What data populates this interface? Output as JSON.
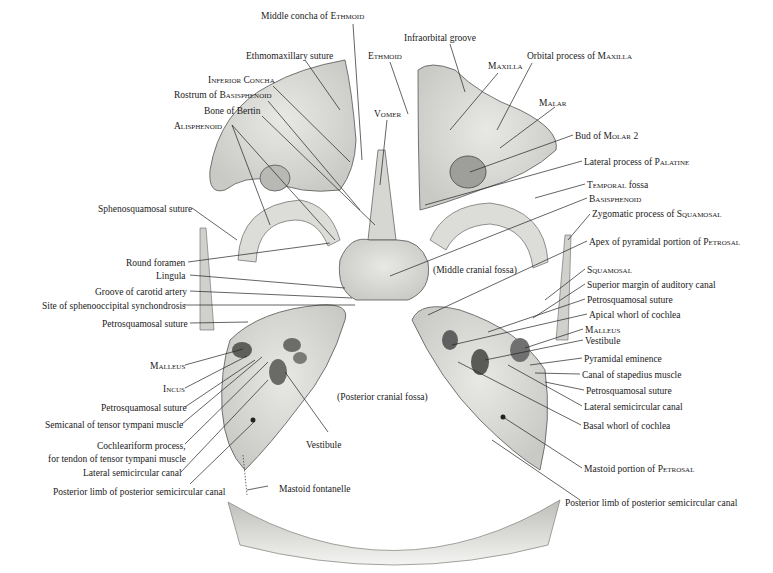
{
  "figure": {
    "colors": {
      "ink": "#1a1a1a",
      "bone_fill": "#d9d9d6",
      "bone_dark": "#6e6e6e",
      "background": "#ffffff"
    }
  },
  "regions": {
    "middle_cranial_fossa": "(Middle cranial fossa)",
    "posterior_cranial_fossa": "(Posterior cranial fossa)"
  },
  "labels_top": [
    {
      "id": "middle-concha",
      "plain": "Middle concha of ",
      "sc": "Ethmoid",
      "x": 261,
      "y": 11
    },
    {
      "id": "ethmomaxillary-suture",
      "plain": "Ethmomaxillary suture",
      "sc": "",
      "x": 246,
      "y": 51
    },
    {
      "id": "ethmoid",
      "plain": "",
      "sc": "Ethmoid",
      "x": 368,
      "y": 51
    },
    {
      "id": "infraorbital-groove",
      "plain": "Infraorbital groove",
      "sc": "",
      "x": 404,
      "y": 33
    },
    {
      "id": "maxilla",
      "plain": "",
      "sc": "Maxilla",
      "x": 488,
      "y": 61
    },
    {
      "id": "orbital-process",
      "plain": "Orbital process of ",
      "sc": "Maxilla",
      "x": 527,
      "y": 51
    }
  ],
  "labels_left": [
    {
      "id": "inferior-concha",
      "plain": "",
      "sc": "Inferior Concha",
      "x": 208,
      "y": 75
    },
    {
      "id": "rostrum",
      "plain": "Rostrum of ",
      "sc": "Basisphenoid",
      "x": 174,
      "y": 90
    },
    {
      "id": "bone-of-bertin",
      "plain": "Bone of Bertin",
      "sc": "",
      "x": 204,
      "y": 106
    },
    {
      "id": "alisphenoid",
      "plain": "",
      "sc": "Alisphenoid",
      "x": 174,
      "y": 121
    },
    {
      "id": "sphenosquamosal-suture",
      "plain": "Sphenosquamosal suture",
      "sc": "",
      "x": 98,
      "y": 204
    },
    {
      "id": "round-foramen",
      "plain": "Round foramen",
      "sc": "",
      "x": 126,
      "y": 258
    },
    {
      "id": "lingula",
      "plain": "Lingula",
      "sc": "",
      "x": 156,
      "y": 271
    },
    {
      "id": "groove-carotid",
      "plain": "Groove of carotid artery",
      "sc": "",
      "x": 95,
      "y": 287
    },
    {
      "id": "sphenooccipital",
      "plain": "Site of sphenooccipital synchondrosis",
      "sc": "",
      "x": 42,
      "y": 301
    },
    {
      "id": "petrosquamosal-l1",
      "plain": "Petrosquamosal suture",
      "sc": "",
      "x": 102,
      "y": 319
    },
    {
      "id": "malleus-l",
      "plain": "",
      "sc": "Malleus",
      "x": 150,
      "y": 361
    },
    {
      "id": "incus-l",
      "plain": "",
      "sc": "Incus",
      "x": 163,
      "y": 384
    },
    {
      "id": "petrosquamosal-l2",
      "plain": "Petrosquamosal suture",
      "sc": "",
      "x": 101,
      "y": 403
    },
    {
      "id": "semicanal-tensor",
      "plain": "Semicanal of tensor tympani muscle",
      "sc": "",
      "x": 45,
      "y": 420
    },
    {
      "id": "cochleariform-1",
      "plain": "Cochleariform process,",
      "sc": "",
      "x": 97,
      "y": 441
    },
    {
      "id": "cochleariform-2",
      "plain": "for tendon of tensor tympani muscle",
      "sc": "",
      "x": 48,
      "y": 454
    },
    {
      "id": "lateral-sc-l",
      "plain": "Lateral semicircular canal",
      "sc": "",
      "x": 83,
      "y": 468
    },
    {
      "id": "posterior-limb-l",
      "plain": "Posterior limb of posterior semicircular canal",
      "sc": "",
      "x": 53,
      "y": 487
    }
  ],
  "labels_center": [
    {
      "id": "vomer",
      "plain": "",
      "sc": "Vomer",
      "x": 374,
      "y": 109
    },
    {
      "id": "vestibule-l",
      "plain": "Vestibule",
      "sc": "",
      "x": 306,
      "y": 440
    },
    {
      "id": "mastoid-fontanelle",
      "plain": "Mastoid fontanelle",
      "sc": "",
      "x": 279,
      "y": 484
    }
  ],
  "labels_right": [
    {
      "id": "malar",
      "plain": "",
      "sc": "Malar",
      "x": 539,
      "y": 98
    },
    {
      "id": "bud-molar",
      "plain": "Bud of ",
      "sc": "Molar 2",
      "x": 575,
      "y": 131
    },
    {
      "id": "lateral-process-palatine",
      "plain": "Lateral process of ",
      "sc": "Palatine",
      "x": 584,
      "y": 157
    },
    {
      "id": "temporal-fossa",
      "plain": "",
      "sc": "Temporal",
      "plain2": " fossa",
      "x": 587,
      "y": 180
    },
    {
      "id": "basisphenoid",
      "plain": "",
      "sc": "Basisphenoid",
      "x": 589,
      "y": 194
    },
    {
      "id": "zygomatic-process",
      "plain": "Zygomatic process of ",
      "sc": "Squamosal",
      "x": 592,
      "y": 209
    },
    {
      "id": "apex-pyramidal",
      "plain": "Apex of pyramidal portion of ",
      "sc": "Petrosal",
      "x": 589,
      "y": 237
    },
    {
      "id": "squamosal",
      "plain": "",
      "sc": "Squamosal",
      "x": 587,
      "y": 265
    },
    {
      "id": "superior-margin",
      "plain": "Superior margin of auditory canal",
      "sc": "",
      "x": 587,
      "y": 280
    },
    {
      "id": "petrosquamosal-r1",
      "plain": "Petrosquamosal suture",
      "sc": "",
      "x": 587,
      "y": 295
    },
    {
      "id": "apical-whorl",
      "plain": "Apical whorl of cochlea",
      "sc": "",
      "x": 589,
      "y": 310
    },
    {
      "id": "malleus-r",
      "plain": "",
      "sc": "Malleus",
      "x": 585,
      "y": 325
    },
    {
      "id": "vestibule-r",
      "plain": "Vestibule",
      "sc": "",
      "x": 585,
      "y": 336
    },
    {
      "id": "pyramidal-eminence",
      "plain": "Pyramidal eminence",
      "sc": "",
      "x": 584,
      "y": 354
    },
    {
      "id": "canal-stapedius",
      "plain": "Canal of stapedius muscle",
      "sc": "",
      "x": 582,
      "y": 370
    },
    {
      "id": "petrosquamosal-r2",
      "plain": "Petrosquamosal suture",
      "sc": "",
      "x": 586,
      "y": 386
    },
    {
      "id": "lateral-sc-r",
      "plain": "Lateral semicircular canal",
      "sc": "",
      "x": 584,
      "y": 402
    },
    {
      "id": "basal-whorl",
      "plain": "Basal whorl of cochlea",
      "sc": "",
      "x": 583,
      "y": 421
    },
    {
      "id": "mastoid-portion",
      "plain": "Mastoid portion of ",
      "sc": "Petrosal",
      "x": 584,
      "y": 464
    },
    {
      "id": "posterior-limb-r",
      "plain": "Posterior limb of posterior semicircular canal",
      "sc": "",
      "x": 565,
      "y": 498
    }
  ]
}
